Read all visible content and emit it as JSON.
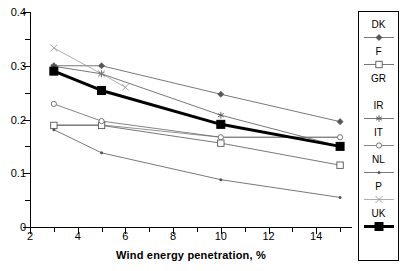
{
  "chart_data": {
    "type": "line",
    "title": "",
    "xlabel": "Wind energy penetration, %",
    "ylabel": "",
    "xlim": [
      2,
      15.5
    ],
    "ylim": [
      0,
      0.4
    ],
    "grid": false,
    "legend_position": "right",
    "x_major_ticks": [
      2,
      4,
      6,
      8,
      10,
      12,
      14
    ],
    "x_minor_ticks": [
      3,
      5,
      7,
      9,
      11,
      13,
      15
    ],
    "x_tick_labels": [
      "2",
      "4",
      "6",
      "8",
      "10",
      "12",
      "14"
    ],
    "y_major_ticks": [
      0,
      0.1,
      0.2,
      0.3,
      0.4
    ],
    "y_minor_ticks": [
      0.05,
      0.15,
      0.25,
      0.35
    ],
    "y_tick_labels": [
      "0",
      "0.1",
      "0.2",
      "0.3",
      "0.4"
    ],
    "series": [
      {
        "name": "DK",
        "marker": "diamond",
        "color": "#555555",
        "linewidth": 0.8,
        "x": [
          3,
          5,
          10,
          15
        ],
        "values": [
          0.3,
          0.3,
          0.247,
          0.196
        ]
      },
      {
        "name": "F",
        "marker": "open-square",
        "color": "#555555",
        "linewidth": 0.8,
        "x": [
          3,
          5,
          10,
          15
        ],
        "values": [
          0.189,
          0.189,
          0.156,
          0.115
        ]
      },
      {
        "name": "GR",
        "marker": "none",
        "color": "#777777",
        "linewidth": 0.8,
        "x": [
          3,
          5,
          10,
          15
        ],
        "values": [
          0.19,
          0.19,
          0.167,
          0.167
        ]
      },
      {
        "name": "IR",
        "marker": "asterisk",
        "color": "#555555",
        "linewidth": 0.8,
        "x": [
          3,
          5,
          10,
          15
        ],
        "values": [
          0.299,
          0.285,
          0.208,
          0.15
        ]
      },
      {
        "name": "IT",
        "marker": "open-circle",
        "color": "#666666",
        "linewidth": 0.8,
        "x": [
          3,
          5,
          10,
          15
        ],
        "values": [
          0.229,
          0.197,
          0.167,
          0.167
        ]
      },
      {
        "name": "NL",
        "marker": "dot",
        "color": "#555555",
        "linewidth": 0.8,
        "x": [
          3,
          5,
          10,
          15
        ],
        "values": [
          0.181,
          0.138,
          0.088,
          0.055
        ]
      },
      {
        "name": "P",
        "marker": "cross",
        "color": "#999999",
        "linewidth": 0.8,
        "x": [
          3,
          5,
          6
        ],
        "values": [
          0.333,
          0.285,
          0.26
        ]
      },
      {
        "name": "UK",
        "marker": "filled-square",
        "color": "#000000",
        "linewidth": 3.0,
        "x": [
          3,
          5,
          10,
          15
        ],
        "values": [
          0.29,
          0.254,
          0.191,
          0.15
        ]
      }
    ]
  },
  "legend": {
    "entries": [
      {
        "label": "DK"
      },
      {
        "label": "F"
      },
      {
        "label": "GR"
      },
      {
        "label": "IR"
      },
      {
        "label": "IT"
      },
      {
        "label": "NL"
      },
      {
        "label": "P"
      },
      {
        "label": "UK"
      }
    ]
  }
}
